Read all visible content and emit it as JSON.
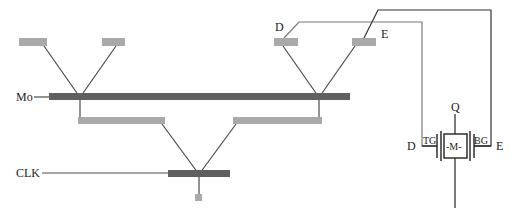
{
  "labels": {
    "mo": "Mo",
    "clk": "CLK",
    "d_top": "D",
    "e_top": "E",
    "q": "Q",
    "d_side": "D",
    "e_side": "E",
    "tg": "TG",
    "bg": "BG",
    "m": "-M-"
  },
  "colors": {
    "light_bar": "#a9a9a9",
    "dark_bar": "#606060",
    "wire": "#4a4a4a",
    "text": "#222222"
  }
}
